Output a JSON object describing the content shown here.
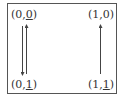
{
  "diagram": {
    "nodes": [
      {
        "id": "n00",
        "prefix": "(0,",
        "payoff": "0",
        "suffix": ")",
        "underlined": true
      },
      {
        "id": "n10",
        "prefix": "(1,",
        "payoff": "0",
        "suffix": ")",
        "underlined": false
      },
      {
        "id": "n01",
        "prefix": "(0,",
        "payoff": "1",
        "suffix": ")",
        "underlined": true
      },
      {
        "id": "n11",
        "prefix": "(1,",
        "payoff": "1",
        "suffix": ")",
        "underlined": true
      }
    ],
    "edges": [
      {
        "from": "(0,0)",
        "to": "(0,1)",
        "direction": "down"
      },
      {
        "from": "(0,1)",
        "to": "(0,0)",
        "direction": "up"
      },
      {
        "from": "(1,1)",
        "to": "(1,0)",
        "direction": "up"
      }
    ],
    "colors": {
      "line": "#444444",
      "text": "#333333",
      "border": "#555555"
    }
  }
}
